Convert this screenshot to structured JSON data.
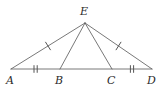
{
  "figure": {
    "kind": "geometry-diagram",
    "stroke_color": "#555555",
    "label_color": "#2b2b2b",
    "background_color": "#ffffff",
    "stroke_width": 0.8,
    "tick_stroke_width": 1.0
  },
  "points": {
    "A": {
      "label": "A",
      "x": 11,
      "y": 69,
      "label_x": 6,
      "label_y": 75
    },
    "B": {
      "label": "B",
      "x": 60,
      "y": 69,
      "label_x": 55,
      "label_y": 75
    },
    "C": {
      "label": "C",
      "x": 112,
      "y": 69,
      "label_x": 107,
      "label_y": 75
    },
    "D": {
      "label": "D",
      "x": 152,
      "y": 69,
      "label_x": 147,
      "label_y": 75
    },
    "E": {
      "label": "E",
      "x": 85,
      "y": 23,
      "label_x": 80,
      "label_y": 6
    }
  },
  "segments": [
    {
      "name": "segment-AE",
      "from": "A",
      "to": "E",
      "ticks": 1
    },
    {
      "name": "segment-ED",
      "from": "E",
      "to": "D",
      "ticks": 1
    },
    {
      "name": "segment-AB",
      "from": "A",
      "to": "B",
      "ticks": 2
    },
    {
      "name": "segment-BC",
      "from": "B",
      "to": "C",
      "ticks": 0
    },
    {
      "name": "segment-CD",
      "from": "C",
      "to": "D",
      "ticks": 2
    },
    {
      "name": "segment-EB",
      "from": "E",
      "to": "B",
      "ticks": 0
    },
    {
      "name": "segment-EC",
      "from": "E",
      "to": "C",
      "ticks": 0
    }
  ],
  "tick_marks": {
    "AE": {
      "count": 1,
      "length": 6
    },
    "ED": {
      "count": 1,
      "length": 6
    },
    "AB": {
      "count": 2,
      "length": 7,
      "spacing": 3
    },
    "CD": {
      "count": 2,
      "length": 7,
      "spacing": 3
    }
  }
}
